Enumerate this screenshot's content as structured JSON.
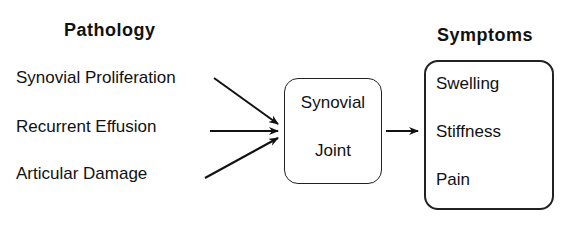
{
  "diagram": {
    "pathology": {
      "heading": "Pathology",
      "items": [
        "Synovial Proliferation",
        "Recurrent Effusion",
        "Articular Damage"
      ]
    },
    "center": {
      "line1": "Synovial",
      "line2": "Joint"
    },
    "symptoms": {
      "heading": "Symptoms",
      "items": [
        "Swelling",
        "Stiffness",
        "Pain"
      ]
    }
  }
}
